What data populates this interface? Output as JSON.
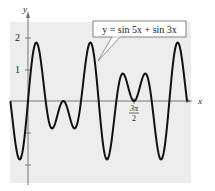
{
  "chart_data": {
    "type": "line",
    "title": "y = sin 5x + sin 3x",
    "xlabel": "x",
    "ylabel": "y",
    "function": "sin(5x) + sin(3x)",
    "xlim": [
      -0.785,
      7.069
    ],
    "ylim": [
      -2,
      2
    ],
    "x_ticks": [
      {
        "value": 4.712,
        "label": "3π/2"
      }
    ],
    "y_ticks": [
      {
        "value": 2,
        "label": "2"
      },
      {
        "value": 1,
        "label": "1"
      },
      {
        "value": -1,
        "label": ""
      },
      {
        "value": -2,
        "label": ""
      }
    ],
    "grid": false,
    "legend": null,
    "annotation": {
      "text": "y = sin 5x + sin 3x",
      "points_to": [
        1.96,
        1.3
      ]
    },
    "series": [
      {
        "name": "y = sin 5x + sin 3x",
        "x": [
          -0.785,
          -0.589,
          -0.393,
          -0.196,
          0,
          0.196,
          0.393,
          0.589,
          0.785,
          0.982,
          1.178,
          1.374,
          1.571,
          1.767,
          1.963,
          2.16,
          2.356,
          2.553,
          2.749,
          2.945,
          3.142,
          3.338,
          3.534,
          3.731,
          3.927,
          4.123,
          4.32,
          4.516,
          4.712,
          4.909,
          5.105,
          5.301,
          5.498,
          5.694,
          5.89,
          6.087,
          6.283,
          6.48,
          6.676,
          6.872,
          7.069
        ],
        "values": [
          0,
          -1.3,
          -1.85,
          -1.39,
          0,
          1.39,
          1.85,
          1.3,
          0,
          -0.76,
          -0.77,
          -0.28,
          0,
          -0.28,
          -0.77,
          -0.76,
          0,
          1.3,
          1.85,
          1.39,
          0,
          -1.39,
          -1.85,
          -1.3,
          0,
          0.76,
          0.77,
          0.28,
          0,
          0.28,
          0.77,
          0.76,
          0,
          -1.3,
          -1.85,
          -1.39,
          0,
          1.39,
          1.85,
          1.3,
          0
        ]
      }
    ]
  },
  "labels": {
    "y_axis": "y",
    "x_axis": "x",
    "tick_2": "2",
    "tick_1": "1",
    "three_pi": "3π",
    "two": "2",
    "equation": "y = sin 5x + sin 3x"
  },
  "colors": {
    "background": "#ededed",
    "curve": "#111111",
    "axis": "#777777",
    "box_border": "#555555"
  }
}
